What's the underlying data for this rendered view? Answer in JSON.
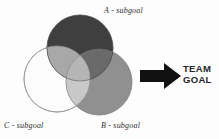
{
  "diagram": {
    "background_color": "#fdfdfd",
    "venn": {
      "circles": [
        {
          "id": "A",
          "label": "A - subgoal",
          "fill": "#3f3f3f",
          "cx": 80,
          "cy": 48,
          "r": 33
        },
        {
          "id": "C",
          "label": "C - subgoal",
          "fill": "#fcfcfc",
          "cx": 57,
          "cy": 79,
          "r": 33
        },
        {
          "id": "B",
          "label": "B - subgoal",
          "fill": "#909090",
          "cx": 99,
          "cy": 82,
          "r": 33
        }
      ],
      "overlap_colors": {
        "a_and_c": "#a8a8a8",
        "a_and_b": "#6a6a6a",
        "b_and_c": "#c8c8c8",
        "a_and_b_and_c": "#b5b5b5"
      },
      "outline_color": "#8c8c8c"
    },
    "arrow": {
      "icon": "right-arrow-icon",
      "color": "#111111",
      "direction": "right"
    },
    "result": {
      "line1": "TEAM",
      "line2": "GOAL",
      "color": "#262626"
    }
  }
}
